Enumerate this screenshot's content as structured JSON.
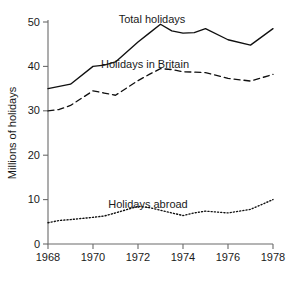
{
  "chart_data": {
    "type": "line",
    "title": "",
    "xlabel": "",
    "ylabel": "Millions of holidays",
    "xlim": [
      1968,
      1978
    ],
    "ylim": [
      0,
      50
    ],
    "grid": false,
    "legend_position": "inline-annotations",
    "x": [
      1968,
      1969,
      1970,
      1971,
      1972,
      1973,
      1974,
      1975,
      1976,
      1977,
      1978
    ],
    "xticks": [
      1968,
      1970,
      1972,
      1974,
      1976,
      1978
    ],
    "xtick_labels": [
      "1968",
      "1970",
      "1972",
      "1974",
      "1976",
      "1978"
    ],
    "yticks": [
      0,
      10,
      20,
      30,
      40,
      50
    ],
    "ytick_labels": [
      "0",
      "10",
      "20",
      "30",
      "40",
      "50"
    ],
    "series": [
      {
        "name": "Total holidays",
        "style": "solid",
        "x": [
          1968,
          1969,
          1970,
          1970.5,
          1971,
          1972,
          1972.5,
          1973,
          1973.5,
          1974,
          1974.5,
          1975,
          1976,
          1977,
          1978
        ],
        "values": [
          35.0,
          36.0,
          40.0,
          40.3,
          41.0,
          45.5,
          47.5,
          49.5,
          48.0,
          47.5,
          47.6,
          48.5,
          46.0,
          44.8,
          48.5
        ]
      },
      {
        "name": "Holidays in Britain",
        "style": "dashed",
        "x": [
          1968,
          1968.5,
          1969,
          1970,
          1970.5,
          1971,
          1972,
          1972.5,
          1973,
          1973.5,
          1974,
          1975,
          1976,
          1977,
          1978
        ],
        "values": [
          30.0,
          30.3,
          31.2,
          34.5,
          34.0,
          33.5,
          36.8,
          38.2,
          39.5,
          39.3,
          38.8,
          38.6,
          37.3,
          36.7,
          38.2
        ]
      },
      {
        "name": "Holidays abroad",
        "style": "dotted",
        "x": [
          1968,
          1968.5,
          1969,
          1970,
          1970.5,
          1971,
          1972,
          1972.5,
          1973,
          1973.5,
          1974,
          1974.5,
          1975,
          1976,
          1977,
          1978
        ],
        "values": [
          4.8,
          5.3,
          5.5,
          6.0,
          6.3,
          7.0,
          8.5,
          8.2,
          7.6,
          7.0,
          6.4,
          7.0,
          7.4,
          7.0,
          7.8,
          10.0
        ]
      }
    ],
    "annotations": [
      {
        "text": "Total holidays",
        "x_px": 152,
        "y_px": 23
      },
      {
        "text": "Holidays in Britain",
        "x_px": 145,
        "y_px": 68
      },
      {
        "text": "Holidays abroad",
        "x_px": 148,
        "y_px": 208
      }
    ],
    "colors": {
      "line": "#101010",
      "axis": "#6b6b6b",
      "text": "#1a1a1a",
      "background": "#ffffff"
    }
  }
}
